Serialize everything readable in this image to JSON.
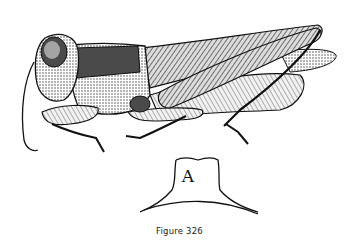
{
  "figure": {
    "caption": "Figure 326",
    "inset_label": "A"
  },
  "colors": {
    "ink": "#111111",
    "paper": "#ffffff",
    "mid_tone": "#8a8a8a"
  }
}
